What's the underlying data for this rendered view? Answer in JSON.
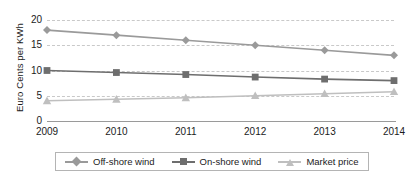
{
  "chart_data": {
    "type": "line",
    "title": "",
    "xlabel": "",
    "ylabel": "Euro Cents per KWh",
    "categories": [
      "2009",
      "2010",
      "2011",
      "2012",
      "2013",
      "2014"
    ],
    "x": [
      2009,
      2010,
      2011,
      2012,
      2013,
      2014
    ],
    "ylim": [
      0,
      20
    ],
    "yticks": [
      0,
      5,
      10,
      15,
      20
    ],
    "ytick_labels": [
      "0",
      "5",
      "10",
      "15",
      "20"
    ],
    "grid": true,
    "grid_style": "dashed horizontal",
    "legend_position": "bottom",
    "series": [
      {
        "name": "Off-shore wind",
        "marker": "diamond",
        "color": "#9a9a9a",
        "values": [
          18.0,
          17.0,
          16.0,
          15.0,
          14.0,
          13.0
        ]
      },
      {
        "name": "On-shore wind",
        "marker": "square",
        "color": "#6e6e6e",
        "values": [
          10.0,
          9.6,
          9.2,
          8.7,
          8.3,
          8.0
        ]
      },
      {
        "name": "Market price",
        "marker": "triangle",
        "color": "#bfbfbf",
        "values": [
          4.0,
          4.3,
          4.6,
          5.0,
          5.4,
          5.8
        ]
      }
    ]
  },
  "axis": {
    "y_title": "Euro Cents per KWh"
  },
  "legend": {
    "items": [
      {
        "label": "Off-shore wind"
      },
      {
        "label": "On-shore wind"
      },
      {
        "label": "Market price"
      }
    ]
  }
}
